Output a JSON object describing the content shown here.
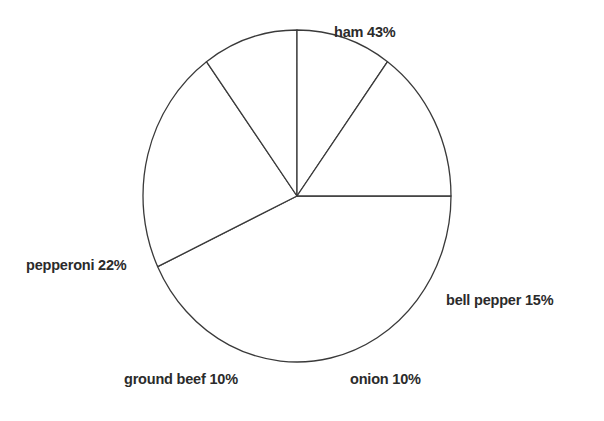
{
  "chart_data": {
    "type": "pie",
    "title": "",
    "subtitle": "",
    "xlabel": "",
    "ylabel": "",
    "grid": false,
    "legend_position": "none",
    "labels_position": "outside",
    "units": "percent",
    "total": 100,
    "categories": [
      "ham",
      "pepperoni",
      "ground beef",
      "onion",
      "bell pepper"
    ],
    "values": [
      43,
      22,
      10,
      10,
      15
    ],
    "slices": [
      {
        "name": "ham",
        "value": 43,
        "label": "ham 43%",
        "start_angle_deg": 0,
        "end_angle_deg": 154.8,
        "color": "#ffffff",
        "stroke": "#3a3a3a"
      },
      {
        "name": "pepperoni",
        "value": 22,
        "label": "pepperoni 22%",
        "start_angle_deg": 154.8,
        "end_angle_deg": 234.0,
        "color": "#ffffff",
        "stroke": "#3a3a3a"
      },
      {
        "name": "ground beef",
        "value": 10,
        "label": "ground beef 10%",
        "start_angle_deg": 234.0,
        "end_angle_deg": 270.0,
        "color": "#ffffff",
        "stroke": "#3a3a3a"
      },
      {
        "name": "onion",
        "value": 10,
        "label": "onion 10%",
        "start_angle_deg": 270.0,
        "end_angle_deg": 306.0,
        "color": "#ffffff",
        "stroke": "#3a3a3a"
      },
      {
        "name": "bell pepper",
        "value": 15,
        "label": "bell pepper 15%",
        "start_angle_deg": 306.0,
        "end_angle_deg": 360.0,
        "color": "#ffffff",
        "stroke": "#3a3a3a"
      }
    ],
    "geometry": {
      "center_x": 297,
      "center_y": 196,
      "radius_x": 154,
      "radius_y": 166,
      "stroke_width": 1.3
    },
    "colors": {
      "background": "#ffffff",
      "outline": "#3a3a3a",
      "text": "#2b2b2b"
    }
  },
  "labels": {
    "ham": "ham 43%",
    "pepperoni": "pepperoni 22%",
    "bell_pepper": "bell pepper 15%",
    "ground_beef": "ground beef 10%",
    "onion": "onion 10%"
  }
}
